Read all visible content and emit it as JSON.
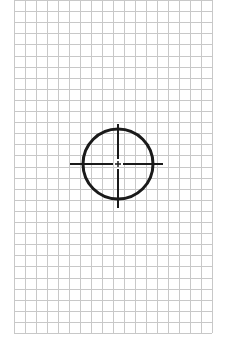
{
  "diagram": {
    "type": "grid-with-target-symbol",
    "background_color": "#ffffff",
    "grid": {
      "x_start": 14,
      "x_end": 212,
      "y_start": 0,
      "y_end": 333,
      "columns": 18,
      "rows": 30,
      "line_color": "#c8c8c8",
      "line_width": 1
    },
    "target": {
      "name": "crosshair-circle",
      "center_x": 118,
      "center_y": 164,
      "radius": 35,
      "stroke_color": "#1a1a1a",
      "circle_stroke_width": 3,
      "line_stroke_width": 2,
      "horizontal_line": {
        "x1": 70,
        "x2": 163
      },
      "vertical_line": {
        "y1": 124,
        "y2": 208
      },
      "center_gap": 5,
      "center_tick": 3
    }
  }
}
